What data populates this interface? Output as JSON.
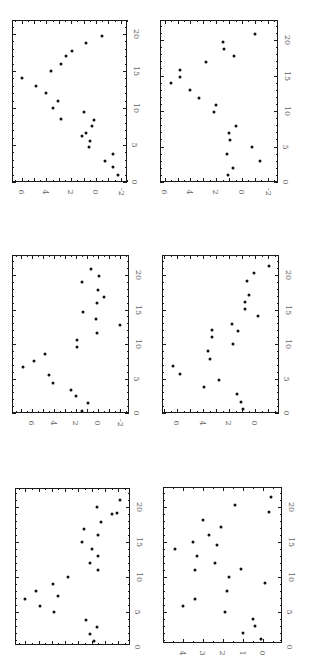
{
  "figure": {
    "orientation": "rotated 90deg clockwise",
    "layout": "3 rows x 2 columns of scatter panels"
  },
  "chart_data": [
    {
      "panel": "row1-left",
      "type": "scatter",
      "title": "",
      "xlabel": "",
      "ylabel": "",
      "xlim": [
        0,
        22
      ],
      "ylim": [
        -2.5,
        6.7
      ],
      "x_ticks": [
        "0",
        "5",
        "10",
        "15",
        "20"
      ],
      "y_ticks": [
        "6",
        "4",
        "2",
        "0",
        "-2"
      ],
      "frame": {
        "left": 12,
        "top": 20,
        "right": 127,
        "bottom": 182
      },
      "map": {
        "x0_px": 182,
        "px_per_x": 7.4,
        "y0_px": 96,
        "px_per_y": 12.4
      },
      "points": [
        {
          "x": 1.0,
          "y": -1.8
        },
        {
          "x": 2.0,
          "y": -1.4
        },
        {
          "x": 2.8,
          "y": -0.7
        },
        {
          "x": 3.8,
          "y": -1.4
        },
        {
          "x": 4.7,
          "y": 0.6
        },
        {
          "x": 5.5,
          "y": 0.5
        },
        {
          "x": 6.2,
          "y": 1.1
        },
        {
          "x": 6.6,
          "y": 0.8
        },
        {
          "x": 7.6,
          "y": 0.3
        },
        {
          "x": 8.4,
          "y": 0.2
        },
        {
          "x": 8.5,
          "y": 2.8
        },
        {
          "x": 9.5,
          "y": 1.0
        },
        {
          "x": 10.0,
          "y": 3.5
        },
        {
          "x": 11.0,
          "y": 3.1
        },
        {
          "x": 12.0,
          "y": 4.0
        },
        {
          "x": 13.0,
          "y": 4.8
        },
        {
          "x": 14.0,
          "y": 6.0
        },
        {
          "x": 15.0,
          "y": 3.6
        },
        {
          "x": 16.0,
          "y": 2.8
        },
        {
          "x": 17.0,
          "y": 2.4
        },
        {
          "x": 17.7,
          "y": 1.9
        },
        {
          "x": 18.8,
          "y": 0.8
        },
        {
          "x": 19.7,
          "y": -0.5
        }
      ]
    },
    {
      "panel": "row1-right",
      "type": "scatter",
      "title": "",
      "xlabel": "",
      "ylabel": "",
      "xlim": [
        0,
        22
      ],
      "ylim": [
        -2.5,
        6.4
      ],
      "x_ticks": [
        "0",
        "5",
        "10",
        "15",
        "20"
      ],
      "y_ticks": [
        "6",
        "4",
        "2",
        "0",
        "-2"
      ],
      "frame": {
        "left": 160,
        "top": 20,
        "right": 278,
        "bottom": 182
      },
      "map": {
        "x0_px": 182,
        "px_per_x": 7.1,
        "y0_px": 242,
        "px_per_y": 12.9
      },
      "points": [
        {
          "x": 1.0,
          "y": 1.1
        },
        {
          "x": 2.0,
          "y": 0.7
        },
        {
          "x": 3.0,
          "y": -1.4
        },
        {
          "x": 3.9,
          "y": 1.2
        },
        {
          "x": 4.9,
          "y": -0.8
        },
        {
          "x": 5.9,
          "y": 0.9
        },
        {
          "x": 6.9,
          "y": 1.0
        },
        {
          "x": 7.9,
          "y": 0.5
        },
        {
          "x": 9.9,
          "y": 2.2
        },
        {
          "x": 10.8,
          "y": 2.0
        },
        {
          "x": 11.8,
          "y": 3.3
        },
        {
          "x": 13.0,
          "y": 4.0
        },
        {
          "x": 13.9,
          "y": 5.5
        },
        {
          "x": 14.8,
          "y": 4.8
        },
        {
          "x": 15.8,
          "y": 4.8
        },
        {
          "x": 16.9,
          "y": 2.8
        },
        {
          "x": 17.7,
          "y": 0.6
        },
        {
          "x": 18.7,
          "y": 1.4
        },
        {
          "x": 19.7,
          "y": 1.5
        },
        {
          "x": 20.8,
          "y": -1.0
        }
      ]
    },
    {
      "panel": "row2-left",
      "type": "scatter",
      "title": "",
      "xlabel": "",
      "ylabel": "",
      "xlim": [
        0,
        22.5
      ],
      "ylim": [
        -2.8,
        7.7
      ],
      "x_ticks": [
        "0",
        "5",
        "10",
        "15",
        "20"
      ],
      "y_ticks": [
        "6",
        "4",
        "2",
        "0",
        "-2"
      ],
      "frame": {
        "left": 12,
        "top": 255,
        "right": 129,
        "bottom": 413
      },
      "map": {
        "x0_px": 413,
        "px_per_x": 6.9,
        "y0_px": 98,
        "px_per_y": 11.0
      },
      "points": [
        {
          "x": 0.3,
          "y": 1.5
        },
        {
          "x": 1.4,
          "y": 0.9
        },
        {
          "x": 2.5,
          "y": 2.0
        },
        {
          "x": 3.3,
          "y": 2.5
        },
        {
          "x": 4.3,
          "y": 4.1
        },
        {
          "x": 5.5,
          "y": 4.5
        },
        {
          "x": 6.7,
          "y": 6.8
        },
        {
          "x": 7.5,
          "y": 5.8
        },
        {
          "x": 8.6,
          "y": 4.8
        },
        {
          "x": 9.6,
          "y": 1.9
        },
        {
          "x": 10.6,
          "y": 1.9
        },
        {
          "x": 11.6,
          "y": 0.1
        },
        {
          "x": 12.8,
          "y": -2.0
        },
        {
          "x": 13.6,
          "y": 0.2
        },
        {
          "x": 14.6,
          "y": 1.4
        },
        {
          "x": 15.9,
          "y": 0.1
        },
        {
          "x": 16.8,
          "y": -0.5
        },
        {
          "x": 17.8,
          "y": 0.0
        },
        {
          "x": 19.0,
          "y": 1.5
        },
        {
          "x": 19.9,
          "y": -0.1
        },
        {
          "x": 20.9,
          "y": 0.6
        }
      ]
    },
    {
      "panel": "row2-right",
      "type": "scatter",
      "title": "",
      "xlabel": "",
      "ylabel": "",
      "xlim": [
        0,
        22.5
      ],
      "ylim": [
        -1.8,
        7.1
      ],
      "x_ticks": [
        "0",
        "5",
        "10",
        "15",
        "20"
      ],
      "y_ticks": [
        "6",
        "4",
        "2",
        "0"
      ],
      "frame": {
        "left": 162,
        "top": 255,
        "right": 279,
        "bottom": 413
      },
      "map": {
        "x0_px": 413,
        "px_per_x": 6.9,
        "y0_px": 255,
        "px_per_y": 13.0
      },
      "points": [
        {
          "x": 0.6,
          "y": 0.9
        },
        {
          "x": 1.6,
          "y": 1.1
        },
        {
          "x": 2.8,
          "y": 1.4
        },
        {
          "x": 3.8,
          "y": 3.9
        },
        {
          "x": 4.8,
          "y": 2.8
        },
        {
          "x": 5.7,
          "y": 5.8
        },
        {
          "x": 6.8,
          "y": 6.3
        },
        {
          "x": 7.8,
          "y": 3.5
        },
        {
          "x": 9.0,
          "y": 3.6
        },
        {
          "x": 10.0,
          "y": 1.7
        },
        {
          "x": 11.0,
          "y": 3.3
        },
        {
          "x": 11.9,
          "y": 1.3
        },
        {
          "x": 12.0,
          "y": 3.3
        },
        {
          "x": 12.9,
          "y": 1.8
        },
        {
          "x": 14.1,
          "y": -0.2
        },
        {
          "x": 15.1,
          "y": 0.8
        },
        {
          "x": 16.1,
          "y": 0.8
        },
        {
          "x": 17.1,
          "y": 0.5
        },
        {
          "x": 19.1,
          "y": 0.6
        },
        {
          "x": 20.3,
          "y": 0.1
        },
        {
          "x": 21.3,
          "y": -1.1
        }
      ]
    },
    {
      "panel": "row3-left",
      "type": "scatter",
      "title": "",
      "xlabel": "",
      "ylabel": "",
      "xlim": [
        0,
        22.7
      ],
      "ylim": [
        -1.9,
        6.7
      ],
      "x_ticks": [
        "0",
        "5",
        "10",
        "15",
        "20"
      ],
      "y_ticks": [
        "",
        "",
        "",
        ""
      ],
      "frame": {
        "left": 15,
        "top": 488,
        "right": 130,
        "bottom": 645
      },
      "map": {
        "x0_px": 647,
        "px_per_x": 7.0,
        "y0_px": 105,
        "px_per_y": 13.3
      },
      "points": [
        {
          "x": 0.9,
          "y": 0.8
        },
        {
          "x": 1.9,
          "y": 1.1
        },
        {
          "x": 2.9,
          "y": 0.6
        },
        {
          "x": 3.9,
          "y": 1.4
        },
        {
          "x": 5.0,
          "y": 3.8
        },
        {
          "x": 5.9,
          "y": 4.9
        },
        {
          "x": 6.9,
          "y": 6.0
        },
        {
          "x": 7.3,
          "y": 3.5
        },
        {
          "x": 8.0,
          "y": 5.2
        },
        {
          "x": 9.0,
          "y": 3.9
        },
        {
          "x": 10.0,
          "y": 2.8
        },
        {
          "x": 11.0,
          "y": 0.5
        },
        {
          "x": 12.0,
          "y": 1.1
        },
        {
          "x": 13.0,
          "y": 0.5
        },
        {
          "x": 14.0,
          "y": 1.0
        },
        {
          "x": 15.0,
          "y": 1.7
        },
        {
          "x": 16.0,
          "y": 0.5
        },
        {
          "x": 16.9,
          "y": 1.6
        },
        {
          "x": 17.9,
          "y": 0.3
        },
        {
          "x": 19.0,
          "y": -0.5
        },
        {
          "x": 19.1,
          "y": -0.9
        },
        {
          "x": 20.0,
          "y": 0.6
        },
        {
          "x": 21.0,
          "y": -1.1
        }
      ]
    },
    {
      "panel": "row3-right",
      "type": "scatter",
      "title": "",
      "xlabel": "",
      "ylabel": "",
      "xlim": [
        0,
        22.8
      ],
      "ylim": [
        -0.95,
        5.0
      ],
      "x_ticks": [
        "0",
        "5",
        "10",
        "15",
        "20"
      ],
      "y_ticks": [
        "4",
        "3",
        "2",
        "1",
        "0"
      ],
      "frame": {
        "left": 163,
        "top": 487,
        "right": 282,
        "bottom": 643
      },
      "map": {
        "x0_px": 647,
        "px_per_x": 7.0,
        "y0_px": 263,
        "px_per_y": 20.0
      },
      "points": [
        {
          "x": 1.1,
          "y": 0.1
        },
        {
          "x": 2.0,
          "y": 1.0
        },
        {
          "x": 3.0,
          "y": 0.4
        },
        {
          "x": 4.0,
          "y": 0.5
        },
        {
          "x": 5.0,
          "y": 1.9
        },
        {
          "x": 5.9,
          "y": 4.0
        },
        {
          "x": 6.9,
          "y": 3.4
        },
        {
          "x": 8.0,
          "y": 1.8
        },
        {
          "x": 9.1,
          "y": -0.1
        },
        {
          "x": 10.0,
          "y": 1.7
        },
        {
          "x": 11.0,
          "y": 3.4
        },
        {
          "x": 11.1,
          "y": 1.1
        },
        {
          "x": 12.0,
          "y": 2.4
        },
        {
          "x": 13.0,
          "y": 3.3
        },
        {
          "x": 14.0,
          "y": 4.4
        },
        {
          "x": 14.6,
          "y": 2.3
        },
        {
          "x": 15.0,
          "y": 3.5
        },
        {
          "x": 16.0,
          "y": 2.7
        },
        {
          "x": 17.1,
          "y": 2.1
        },
        {
          "x": 18.1,
          "y": 3.0
        },
        {
          "x": 19.3,
          "y": -0.3
        },
        {
          "x": 20.3,
          "y": 1.4
        },
        {
          "x": 21.4,
          "y": -0.4
        }
      ]
    }
  ]
}
